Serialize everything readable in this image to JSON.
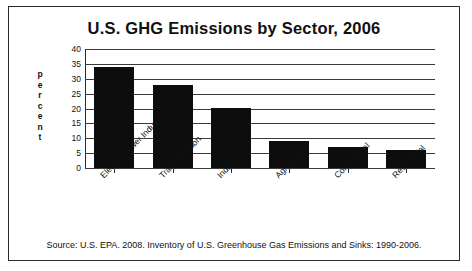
{
  "chart_data": {
    "type": "bar",
    "title": "U.S. GHG Emissions by Sector, 2006",
    "xlabel": "",
    "ylabel": "percent",
    "ylabel_letters": [
      "p",
      "e",
      "r",
      "c",
      "e",
      "n",
      "t"
    ],
    "categories": [
      "Electric Power Industry",
      "Transportation",
      "Industry",
      "Agriculture",
      "Commercial",
      "Residential"
    ],
    "values": [
      34,
      28,
      20,
      9,
      7,
      6
    ],
    "ylim": [
      0,
      40
    ],
    "yticks": [
      0,
      5,
      10,
      15,
      20,
      25,
      30,
      35,
      40
    ],
    "ytick_labels": [
      "0",
      "5",
      "10",
      "15",
      "20",
      "25",
      "30",
      "35",
      "40"
    ],
    "grid": true,
    "legend": "none",
    "bar_color": "#0d0d0d"
  },
  "source": {
    "text": "Source:  U.S. EPA. 2008. Inventory of U.S. Greenhouse Gas Emissions and Sinks:  1990-2006."
  },
  "colors": {
    "border": "#2b2b2b",
    "text": "#111111",
    "bar": "#0d0d0d",
    "grid": "#3a3a3a"
  }
}
